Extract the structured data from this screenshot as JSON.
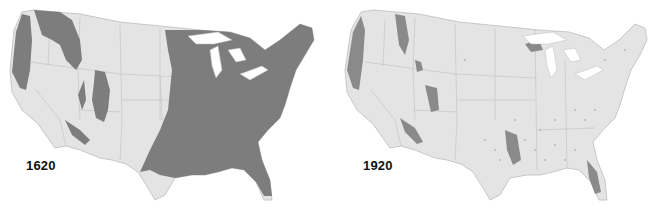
{
  "figure": {
    "colors": {
      "land": "#e4e4e4",
      "forest": "#7d7d7d",
      "borders": "#b8b8b8",
      "background": "#ffffff"
    },
    "maps": [
      {
        "year_label": "1620",
        "position": "left"
      },
      {
        "year_label": "1920",
        "position": "right"
      }
    ]
  }
}
